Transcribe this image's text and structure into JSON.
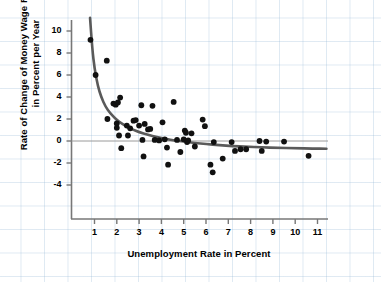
{
  "chart_data": {
    "type": "scatter",
    "title": "",
    "xlabel": "Unemployment Rate in Percent",
    "ylabel": "Rate of Change of Money Wage Rates in Percent per Year",
    "xlim": [
      0.3,
      11.6
    ],
    "ylim": [
      -5.2,
      11.2
    ],
    "xticks": [
      1,
      2,
      3,
      4,
      5,
      6,
      7,
      8,
      9,
      10,
      11
    ],
    "xtick_labels": [
      "1",
      "2",
      "3",
      "4",
      "5",
      "6",
      "7",
      "8",
      "9",
      "10",
      "11"
    ],
    "yticks": [
      10,
      8,
      6,
      4,
      2,
      0,
      -2,
      -4
    ],
    "ytick_labels": [
      "10",
      "8",
      "6",
      "4",
      "2",
      "0",
      "-2",
      "-4"
    ],
    "grid": "background graph-paper grid, light blue",
    "zero_line": 0,
    "legend": "none",
    "point_color": "#111111",
    "curve_color": "#555555",
    "series": [
      {
        "name": "Observations",
        "points": [
          [
            0.82,
            9.2
          ],
          [
            1.05,
            6.0
          ],
          [
            1.55,
            7.3
          ],
          [
            1.58,
            2.0
          ],
          [
            1.85,
            3.4
          ],
          [
            1.95,
            3.3
          ],
          [
            2.0,
            1.6
          ],
          [
            2.0,
            1.2
          ],
          [
            2.05,
            3.5
          ],
          [
            2.1,
            0.5
          ],
          [
            2.15,
            3.95
          ],
          [
            2.2,
            -0.65
          ],
          [
            2.45,
            1.4
          ],
          [
            2.5,
            0.5
          ],
          [
            2.6,
            1.15
          ],
          [
            2.75,
            1.85
          ],
          [
            2.85,
            1.9
          ],
          [
            3.0,
            1.4
          ],
          [
            3.1,
            3.25
          ],
          [
            3.15,
            0.1
          ],
          [
            3.2,
            -1.4
          ],
          [
            3.25,
            1.55
          ],
          [
            3.4,
            1.05
          ],
          [
            3.5,
            1.1
          ],
          [
            3.6,
            3.2
          ],
          [
            3.7,
            0.1
          ],
          [
            3.9,
            0.05
          ],
          [
            4.05,
            1.7
          ],
          [
            4.15,
            0.15
          ],
          [
            4.25,
            -0.6
          ],
          [
            4.3,
            -2.15
          ],
          [
            4.55,
            3.55
          ],
          [
            4.7,
            0.1
          ],
          [
            4.85,
            -1.0
          ],
          [
            5.0,
            0.15
          ],
          [
            5.05,
            0.95
          ],
          [
            5.1,
            0.75
          ],
          [
            5.15,
            -0.1
          ],
          [
            5.2,
            0.05
          ],
          [
            5.35,
            0.7
          ],
          [
            5.5,
            -0.5
          ],
          [
            5.85,
            1.95
          ],
          [
            5.95,
            1.35
          ],
          [
            6.2,
            -2.15
          ],
          [
            6.3,
            -2.85
          ],
          [
            6.35,
            -0.1
          ],
          [
            6.75,
            -1.6
          ],
          [
            7.15,
            -0.1
          ],
          [
            7.3,
            -0.9
          ],
          [
            7.55,
            -0.75
          ],
          [
            7.8,
            -0.75
          ],
          [
            8.4,
            0.0
          ],
          [
            8.5,
            -0.9
          ],
          [
            8.7,
            -0.05
          ],
          [
            9.5,
            -0.05
          ],
          [
            10.6,
            -1.35
          ]
        ]
      }
    ],
    "fitted_curve": {
      "name": "Phillips curve (fitted)",
      "description": "hyperbolic fit, asymptote near -0.8",
      "points": [
        [
          0.8,
          11.2
        ],
        [
          0.9,
          8.4
        ],
        [
          1.0,
          6.6
        ],
        [
          1.15,
          5.0
        ],
        [
          1.3,
          4.0
        ],
        [
          1.5,
          3.1
        ],
        [
          1.7,
          2.55
        ],
        [
          1.9,
          2.1
        ],
        [
          2.1,
          1.75
        ],
        [
          2.4,
          1.35
        ],
        [
          2.7,
          1.05
        ],
        [
          3.0,
          0.8
        ],
        [
          3.4,
          0.55
        ],
        [
          3.8,
          0.35
        ],
        [
          4.2,
          0.18
        ],
        [
          4.6,
          0.05
        ],
        [
          5.0,
          -0.06
        ],
        [
          5.5,
          -0.18
        ],
        [
          6.0,
          -0.28
        ],
        [
          6.6,
          -0.38
        ],
        [
          7.2,
          -0.46
        ],
        [
          7.8,
          -0.52
        ],
        [
          8.5,
          -0.58
        ],
        [
          9.2,
          -0.62
        ],
        [
          10.0,
          -0.66
        ],
        [
          10.8,
          -0.69
        ],
        [
          11.4,
          -0.7
        ]
      ]
    }
  },
  "source": {
    "text": "SOURCE: A. W. Phillips, “The Relation between Unemployment and the Rate of Change of Money Wages in the United Kingdom, 1861–1957,” Economica, New Series, 25 (November 1958)."
  }
}
